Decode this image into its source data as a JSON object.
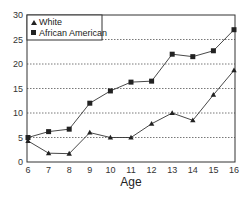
{
  "chart_data": {
    "type": "line",
    "title": "",
    "xlabel": "Age",
    "ylabel": "",
    "x": [
      6,
      7,
      8,
      9,
      10,
      11,
      12,
      13,
      14,
      15,
      16
    ],
    "xticks": [
      "6",
      "7",
      "8",
      "9",
      "10",
      "11",
      "12",
      "13",
      "14",
      "15",
      "16"
    ],
    "yticks": [
      "0",
      "5",
      "10",
      "15",
      "20",
      "25",
      "30"
    ],
    "ylim": [
      0,
      30
    ],
    "grid": "horizontal dotted at 5,10,15,20,25",
    "legend_position": "top-left inside",
    "series": [
      {
        "name": "White",
        "marker": "triangle",
        "values": [
          4.3,
          1.8,
          1.7,
          6.0,
          5.0,
          5.0,
          7.8,
          10.0,
          8.5,
          13.7,
          18.7
        ]
      },
      {
        "name": "African American",
        "marker": "square",
        "values": [
          5.0,
          6.2,
          6.7,
          12.0,
          14.5,
          16.3,
          16.5,
          22.0,
          21.5,
          22.7,
          27.0
        ]
      }
    ]
  },
  "legend": {
    "white_label": "White",
    "african_american_label": "African American"
  },
  "axis": {
    "x_title": "Age"
  }
}
